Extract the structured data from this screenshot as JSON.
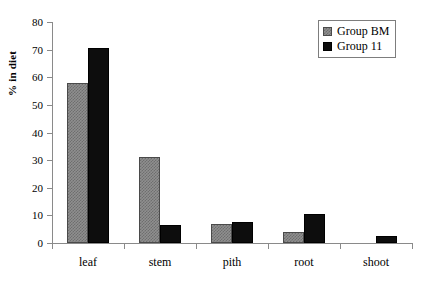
{
  "chart_data": {
    "type": "bar",
    "title": "",
    "subtitle": "",
    "xlabel": "",
    "ylabel": "% in diet",
    "categories": [
      "leaf",
      "stem",
      "pith",
      "root",
      "shoot"
    ],
    "series": [
      {
        "name": "Group BM",
        "values": [
          58,
          31,
          7,
          4,
          0
        ],
        "color": "#8f8f8f",
        "pattern": "checker"
      },
      {
        "name": "Group 11",
        "values": [
          70.5,
          6.5,
          7.5,
          10.5,
          2.5
        ],
        "color": "#0d0d0d",
        "pattern": "solid"
      }
    ],
    "ylim": [
      0,
      80
    ],
    "ytick_values": [
      0,
      10,
      20,
      30,
      40,
      50,
      60,
      70,
      80
    ],
    "ytick_labels": [
      "0",
      "10",
      "20",
      "30",
      "40",
      "50",
      "60",
      "70",
      "80"
    ],
    "grid": false,
    "legend_position": "top-right",
    "axis_color": "#8a8a8a"
  },
  "legend": {
    "entries": [
      {
        "label": "Group BM"
      },
      {
        "label": "Group 11"
      }
    ]
  }
}
